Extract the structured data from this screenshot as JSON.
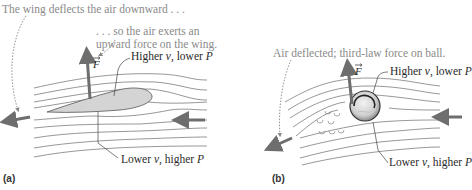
{
  "panel_a": {
    "label": "(a)",
    "caption_top": "The wing deflects the air downward . . .",
    "caption_mid_line1": ". . . so the air exerts an",
    "caption_mid_line2": "upward force on the wing.",
    "upper_label_prefix": "Higher ",
    "upper_label_v": "v",
    "upper_label_suffix": ", lower ",
    "upper_label_P": "P",
    "lower_label_prefix": "Lower ",
    "lower_label_v": "v",
    "lower_label_suffix": ", higher ",
    "lower_label_P": "P",
    "force_symbol": "F"
  },
  "panel_b": {
    "label": "(b)",
    "caption_top": "Air deflected; third-law force on ball.",
    "upper_label_prefix": "Higher ",
    "upper_label_v": "v",
    "upper_label_suffix": ", lower ",
    "upper_label_P": "P",
    "lower_label_prefix": "Lower ",
    "lower_label_v": "v",
    "lower_label_suffix": ", higher ",
    "lower_label_P": "P",
    "force_symbol": "F"
  },
  "colors": {
    "streamline": "#6a6a6a",
    "arrow": "#6e6e6e",
    "wing_fill": "#d4d4d4",
    "text_gray": "#8a8a8a",
    "text_dark": "#2a2a2a"
  }
}
